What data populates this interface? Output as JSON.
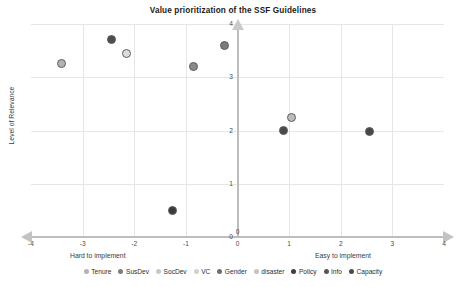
{
  "chart_data": {
    "type": "scatter",
    "title": "Value prioritization of the SSF Guidelines",
    "xlabel": "",
    "ylabel": "Level of Relevance",
    "xlabel_left": "Hard to implement",
    "xlabel_right": "Easy to implement",
    "xlim": [
      -4,
      4
    ],
    "ylim": [
      0,
      4
    ],
    "xticks": [
      "-4",
      "-3",
      "-2",
      "-1",
      "0",
      "1",
      "2",
      "3",
      "4"
    ],
    "xtick_values": [
      -4,
      -3,
      -2,
      -1,
      0,
      1,
      2,
      3,
      4
    ],
    "yticks": [
      "0",
      "1",
      "2",
      "3",
      "4"
    ],
    "ytick_values": [
      0,
      1,
      2,
      3,
      4
    ],
    "grid": true,
    "legend_position": "bottom",
    "axis_origin_label": "0",
    "series": [
      {
        "name": "Tenure",
        "x": -3.4,
        "y": 3.25,
        "color": "#b3b3b3"
      },
      {
        "name": "SusDev",
        "x": -2.45,
        "y": 3.7,
        "color": "#4d4d4d"
      },
      {
        "name": "SocDev",
        "x": -2.15,
        "y": 3.45,
        "color": "#dcdcdc"
      },
      {
        "name": "VC",
        "x": -0.85,
        "y": 3.2,
        "color": "#8a8a8a"
      },
      {
        "name": "Gender",
        "x": -0.25,
        "y": 3.6,
        "color": "#7a7a7a"
      },
      {
        "name": "disaster",
        "x": -1.25,
        "y": 0.5,
        "color": "#3a3a3a"
      },
      {
        "name": "Policy",
        "x": 0.9,
        "y": 2.0,
        "color": "#4a4a4a"
      },
      {
        "name": "Info",
        "x": 1.05,
        "y": 2.25,
        "color": "#bcbcbc"
      },
      {
        "name": "Capacity",
        "x": 2.55,
        "y": 1.98,
        "color": "#474747"
      }
    ]
  },
  "legend": {
    "items": [
      {
        "label": "Tenure",
        "color": "#b3b3b3"
      },
      {
        "label": "SusDev",
        "color": "#7d7d7d"
      },
      {
        "label": "SocDev",
        "color": "#c9c9c9"
      },
      {
        "label": "VC",
        "color": "#d0d0d0"
      },
      {
        "label": "Gender",
        "color": "#6e6e6e"
      },
      {
        "label": "disaster",
        "color": "#c4c4c4"
      },
      {
        "label": "Policy",
        "color": "#3f3f3f"
      },
      {
        "label": "Info",
        "color": "#555555"
      },
      {
        "label": "Capacity",
        "color": "#4a4a4a"
      }
    ]
  }
}
